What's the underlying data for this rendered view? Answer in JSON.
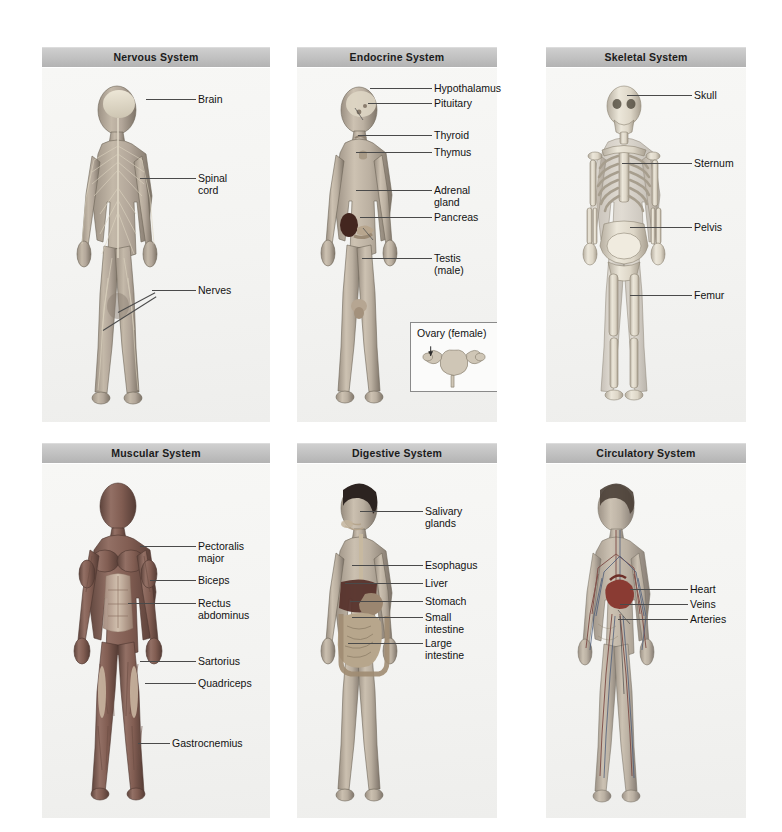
{
  "figure_caption": "Human body systems — six anatomical panels",
  "panels": [
    {
      "id": "nervous",
      "title": "Nervous System",
      "rect": {
        "x": 42,
        "y": 47,
        "w": 228,
        "h": 375
      },
      "labels": [
        {
          "name": "label-brain",
          "text": "Brain",
          "x": 198,
          "y": 94,
          "leader": {
            "x1": 196,
            "y1": 99,
            "x2": 146,
            "y2": 99
          }
        },
        {
          "name": "label-spinal-cord",
          "text": "Spinal\ncord",
          "x": 198,
          "y": 173,
          "leader": {
            "x1": 196,
            "y1": 178,
            "x2": 140,
            "y2": 178
          }
        },
        {
          "name": "label-nerves",
          "text": "Nerves",
          "x": 198,
          "y": 285,
          "leader": {
            "x1": 196,
            "y1": 290,
            "x2": 152,
            "y2": 290
          }
        },
        {
          "name": "label-nerves-branch",
          "text": "",
          "x": 0,
          "y": 0,
          "leader": {
            "x1": 152,
            "y1": 290,
            "x2": 103,
            "y2": 330
          }
        }
      ]
    },
    {
      "id": "endocrine",
      "title": "Endocrine System",
      "rect": {
        "x": 297,
        "y": 47,
        "w": 200,
        "h": 375
      },
      "labels": [
        {
          "name": "label-hypothalamus",
          "text": "Hypothalamus",
          "x": 434,
          "y": 83,
          "leader": {
            "x1": 432,
            "y1": 88,
            "x2": 370,
            "y2": 88
          }
        },
        {
          "name": "label-pituitary",
          "text": "Pituitary",
          "x": 434,
          "y": 98,
          "leader": {
            "x1": 432,
            "y1": 103,
            "x2": 368,
            "y2": 103
          }
        },
        {
          "name": "label-thyroid",
          "text": "Thyroid",
          "x": 434,
          "y": 130,
          "leader": {
            "x1": 432,
            "y1": 135,
            "x2": 358,
            "y2": 135
          }
        },
        {
          "name": "label-thymus",
          "text": "Thymus",
          "x": 434,
          "y": 147,
          "leader": {
            "x1": 432,
            "y1": 152,
            "x2": 356,
            "y2": 152
          }
        },
        {
          "name": "label-adreanal-gland",
          "text": "Adrenal\ngland",
          "x": 434,
          "y": 185,
          "leader": {
            "x1": 432,
            "y1": 190,
            "x2": 356,
            "y2": 190
          }
        },
        {
          "name": "label-pancreas",
          "text": "Pancreas",
          "x": 434,
          "y": 212,
          "leader": {
            "x1": 432,
            "y1": 217,
            "x2": 360,
            "y2": 217
          }
        },
        {
          "name": "label-testis",
          "text": "Testis\n(male)",
          "x": 434,
          "y": 253,
          "leader": {
            "x1": 432,
            "y1": 258,
            "x2": 362,
            "y2": 258
          }
        }
      ],
      "inset": {
        "name": "ovary-inset",
        "title": "Ovary (female)",
        "rect": {
          "x": 410,
          "y": 322,
          "w": 88,
          "h": 70
        }
      }
    },
    {
      "id": "skeletal",
      "title": "Skeletal System",
      "rect": {
        "x": 546,
        "y": 47,
        "w": 200,
        "h": 375
      },
      "labels": [
        {
          "name": "label-skull",
          "text": "Skull",
          "x": 694,
          "y": 90,
          "leader": {
            "x1": 692,
            "y1": 95,
            "x2": 627,
            "y2": 95
          }
        },
        {
          "name": "label-sternum",
          "text": "Sternum",
          "x": 694,
          "y": 158,
          "leader": {
            "x1": 692,
            "y1": 163,
            "x2": 622,
            "y2": 163
          }
        },
        {
          "name": "label-pelvis",
          "text": "Pelvis",
          "x": 694,
          "y": 222,
          "leader": {
            "x1": 692,
            "y1": 227,
            "x2": 630,
            "y2": 227
          }
        },
        {
          "name": "label-femur",
          "text": "Femur",
          "x": 694,
          "y": 290,
          "leader": {
            "x1": 692,
            "y1": 295,
            "x2": 630,
            "y2": 295
          }
        }
      ]
    },
    {
      "id": "muscular",
      "title": "Muscular System",
      "rect": {
        "x": 42,
        "y": 443,
        "w": 228,
        "h": 375
      },
      "labels": [
        {
          "name": "label-pectoralis-major",
          "text": "Pectoralis\nmajor",
          "x": 198,
          "y": 541,
          "leader": {
            "x1": 196,
            "y1": 546,
            "x2": 140,
            "y2": 546
          }
        },
        {
          "name": "label-biceps",
          "text": "Biceps",
          "x": 198,
          "y": 575,
          "leader": {
            "x1": 196,
            "y1": 580,
            "x2": 150,
            "y2": 580
          }
        },
        {
          "name": "label-rectus-abdominus",
          "text": "Rectus\nabdominus",
          "x": 198,
          "y": 598,
          "leader": {
            "x1": 196,
            "y1": 603,
            "x2": 128,
            "y2": 603
          }
        },
        {
          "name": "label-sartorius",
          "text": "Sartorius",
          "x": 198,
          "y": 656,
          "leader": {
            "x1": 196,
            "y1": 661,
            "x2": 140,
            "y2": 661
          }
        },
        {
          "name": "label-quadriceps",
          "text": "Quadriceps",
          "x": 198,
          "y": 678,
          "leader": {
            "x1": 196,
            "y1": 683,
            "x2": 145,
            "y2": 683
          }
        },
        {
          "name": "label-gastrocnemius",
          "text": "Gastrocnemius",
          "x": 172,
          "y": 738,
          "leader": {
            "x1": 170,
            "y1": 743,
            "x2": 138,
            "y2": 743
          }
        }
      ]
    },
    {
      "id": "digestive",
      "title": "Digestive System",
      "rect": {
        "x": 297,
        "y": 443,
        "w": 200,
        "h": 375
      },
      "labels": [
        {
          "name": "label-salivary-glands",
          "text": "Salivary\nglands",
          "x": 425,
          "y": 506,
          "leader": {
            "x1": 423,
            "y1": 511,
            "x2": 360,
            "y2": 511
          }
        },
        {
          "name": "label-esophagus",
          "text": "Esophagus",
          "x": 425,
          "y": 560,
          "leader": {
            "x1": 423,
            "y1": 565,
            "x2": 352,
            "y2": 565
          }
        },
        {
          "name": "label-liver",
          "text": "Liver",
          "x": 425,
          "y": 578,
          "leader": {
            "x1": 423,
            "y1": 583,
            "x2": 345,
            "y2": 583
          }
        },
        {
          "name": "label-stomach",
          "text": "Stomach",
          "x": 425,
          "y": 596,
          "leader": {
            "x1": 423,
            "y1": 601,
            "x2": 350,
            "y2": 601
          }
        },
        {
          "name": "label-small-intestine",
          "text": "Small\nintestine",
          "x": 425,
          "y": 612,
          "leader": {
            "x1": 423,
            "y1": 617,
            "x2": 352,
            "y2": 617
          }
        },
        {
          "name": "label-large-intestine",
          "text": "Large\nintestine",
          "x": 425,
          "y": 638,
          "leader": {
            "x1": 423,
            "y1": 643,
            "x2": 348,
            "y2": 643
          }
        }
      ]
    },
    {
      "id": "circulatory",
      "title": "Circulatory System",
      "rect": {
        "x": 546,
        "y": 443,
        "w": 200,
        "h": 375
      },
      "labels": [
        {
          "name": "label-heart",
          "text": "Heart",
          "x": 690,
          "y": 584,
          "leader": {
            "x1": 688,
            "y1": 589,
            "x2": 630,
            "y2": 589
          }
        },
        {
          "name": "label-veins",
          "text": "Veins",
          "x": 690,
          "y": 599,
          "leader": {
            "x1": 688,
            "y1": 604,
            "x2": 620,
            "y2": 604
          }
        },
        {
          "name": "label-arteries",
          "text": "Arteries",
          "x": 690,
          "y": 614,
          "leader": {
            "x1": 688,
            "y1": 619,
            "x2": 618,
            "y2": 619
          }
        }
      ]
    }
  ],
  "colors": {
    "header_gradient_top": "#cfcfcf",
    "header_gradient_bottom": "#b3b3b3",
    "panel_background": "#f4f4f2",
    "label_text": "#121212",
    "leader_line": "#4a4a4a",
    "skin_light": "#cfc4b6",
    "skin_mid": "#a89a8b",
    "skin_dark": "#6f655b",
    "bone": "#e3ded2",
    "bone_shadow": "#b9b2a3",
    "muscle": "#8f6a5e",
    "muscle_dark": "#6b4a41",
    "organ_liver": "#6b3f38",
    "organ_intestine": "#b9a38c",
    "nerve": "#d8d2c4",
    "artery": "#a24a42",
    "vein": "#4a5a78",
    "adrenal": "#4a2c2a",
    "heart": "#8e3b33"
  }
}
